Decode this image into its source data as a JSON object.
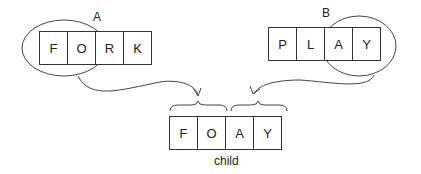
{
  "parents": [
    {
      "label": "A",
      "genes": [
        "F",
        "O",
        "R",
        "K"
      ]
    },
    {
      "label": "B",
      "genes": [
        "P",
        "L",
        "A",
        "Y"
      ]
    }
  ],
  "child": {
    "label": "child",
    "genes": [
      "F",
      "O",
      "A",
      "Y"
    ]
  }
}
